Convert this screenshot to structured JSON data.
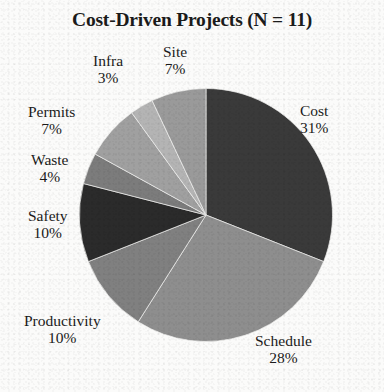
{
  "title": "Cost-Driven Projects (N = 11)",
  "chart_data": {
    "type": "pie",
    "title": "Cost-Driven Projects (N = 11)",
    "sample_size": 11,
    "units": "percent",
    "start_angle_deg": 0,
    "direction": "clockwise",
    "legend": "none (labels placed outside slices)",
    "grid": false,
    "categories": [
      "Cost",
      "Schedule",
      "Productivity",
      "Safety",
      "Waste",
      "Permits",
      "Infra",
      "Site"
    ],
    "values": [
      31,
      28,
      10,
      10,
      4,
      7,
      3,
      7
    ],
    "slices": [
      {
        "label": "Cost",
        "percent": 31,
        "percent_text": "31%",
        "color": "#3a3a3a"
      },
      {
        "label": "Schedule",
        "percent": 28,
        "percent_text": "28%",
        "color": "#8e8e8e"
      },
      {
        "label": "Productivity",
        "percent": 10,
        "percent_text": "10%",
        "color": "#808080"
      },
      {
        "label": "Safety",
        "percent": 10,
        "percent_text": "10%",
        "color": "#2b2b2b"
      },
      {
        "label": "Waste",
        "percent": 4,
        "percent_text": "4%",
        "color": "#7c7c7c"
      },
      {
        "label": "Permits",
        "percent": 7,
        "percent_text": "7%",
        "color": "#a0a0a0"
      },
      {
        "label": "Infra",
        "percent": 3,
        "percent_text": "3%",
        "color": "#b4b4b4"
      },
      {
        "label": "Site",
        "percent": 7,
        "percent_text": "7%",
        "color": "#9a9a9a"
      }
    ]
  },
  "labels": {
    "cost": {
      "name": "Cost",
      "pct": "31%"
    },
    "schedule": {
      "name": "Schedule",
      "pct": "28%"
    },
    "productivity": {
      "name": "Productivity",
      "pct": "10%"
    },
    "safety": {
      "name": "Safety",
      "pct": "10%"
    },
    "waste": {
      "name": "Waste",
      "pct": "4%"
    },
    "permits": {
      "name": "Permits",
      "pct": "7%"
    },
    "infra": {
      "name": "Infra",
      "pct": "3%"
    },
    "site": {
      "name": "Site",
      "pct": "7%"
    }
  },
  "colors": {
    "background": "#fbfbfa",
    "text": "#1b1b1b"
  }
}
